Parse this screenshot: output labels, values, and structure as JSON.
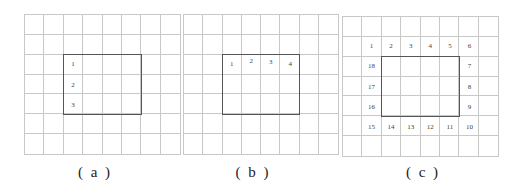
{
  "figure": {
    "grid": {
      "columns": 8,
      "rows": 7,
      "line_color": "#c8c8c8",
      "rect_color": "#555555"
    },
    "panels": [
      {
        "id": "a",
        "caption": "( a )",
        "grid_box": {
          "x": 24,
          "y": 14,
          "w": 157,
          "h": 141
        },
        "rect": {
          "col_start": 2,
          "col_end": 6,
          "row_start": 2,
          "row_end": 5
        },
        "labels": [
          {
            "text": "1",
            "col": 2,
            "row": 2
          },
          {
            "text": "2",
            "col": 2,
            "row": 3
          },
          {
            "text": "3",
            "col": 2,
            "row": 4
          }
        ],
        "caption_x": 95
      },
      {
        "id": "b",
        "caption": "( b )",
        "grid_box": {
          "x": 183,
          "y": 14,
          "w": 156,
          "h": 141
        },
        "rect": {
          "col_start": 2,
          "col_end": 6,
          "row_start": 2,
          "row_end": 5
        },
        "labels": [
          {
            "text": "1",
            "col": 2,
            "row": 2
          },
          {
            "text": "2",
            "col": 3,
            "row": 2,
            "dy": -3
          },
          {
            "text": "3",
            "col": 4,
            "row": 2,
            "dy": -2
          },
          {
            "text": "4",
            "col": 5,
            "row": 2
          }
        ],
        "caption_x": 253
      },
      {
        "id": "c",
        "caption": "( c )",
        "grid_box": {
          "x": 342,
          "y": 16,
          "w": 157,
          "h": 141
        },
        "rect": {
          "col_start": 2,
          "col_end": 6,
          "row_start": 2,
          "row_end": 5
        },
        "labels": [
          {
            "text": "1",
            "col": 1,
            "row": 1
          },
          {
            "text": "2",
            "col": 2,
            "row": 1
          },
          {
            "text": "3",
            "col": 3,
            "row": 1
          },
          {
            "text": "4",
            "col": 4,
            "row": 1
          },
          {
            "text": "5",
            "col": 5,
            "row": 1
          },
          {
            "text": "6",
            "col": 6,
            "row": 1
          },
          {
            "text": "7",
            "col": 6,
            "row": 2
          },
          {
            "text": "8",
            "col": 6,
            "row": 3
          },
          {
            "text": "9",
            "col": 6,
            "row": 4
          },
          {
            "text": "10",
            "col": 6,
            "row": 5
          },
          {
            "text": "11",
            "col": 5,
            "row": 5
          },
          {
            "text": "12",
            "col": 4,
            "row": 5
          },
          {
            "text": "13",
            "col": 3,
            "row": 5
          },
          {
            "text": "14",
            "col": 2,
            "row": 5
          },
          {
            "text": "15",
            "col": 1,
            "row": 5
          },
          {
            "text": "16",
            "col": 1,
            "row": 4
          },
          {
            "text": "17",
            "col": 1,
            "row": 3
          },
          {
            "text": "18",
            "col": 1,
            "row": 2
          }
        ],
        "caption_x": 423
      }
    ]
  }
}
